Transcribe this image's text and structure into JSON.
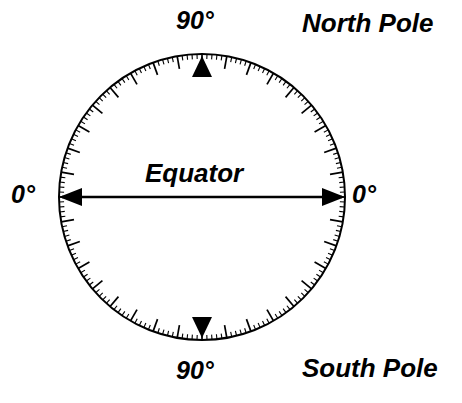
{
  "figure": {
    "background_color": "#ffffff",
    "ink_color": "#000000"
  },
  "labels": {
    "north_degree": "90°",
    "south_degree": "90°",
    "west_degree": "0°",
    "east_degree": "0°",
    "equator": "Equator",
    "north_pole": "North Pole",
    "south_pole": "South Pole"
  },
  "chart_data": {
    "type": "scatter",
    "xlabel": "",
    "ylabel": "",
    "grid": false,
    "legend_position": "none",
    "geometry": {
      "center_x": 202,
      "center_y": 197,
      "radius": 143,
      "stroke_width": 2
    },
    "annotations": [
      {
        "name": "north-pole-degree",
        "text": "90°",
        "angle_deg": 90,
        "position": "outside-top"
      },
      {
        "name": "south-pole-degree",
        "text": "90°",
        "angle_deg": -90,
        "position": "outside-bottom"
      },
      {
        "name": "west-equator-degree",
        "text": "0°",
        "angle_deg": 180,
        "position": "outside-left"
      },
      {
        "name": "east-equator-degree",
        "text": "0°",
        "angle_deg": 0,
        "position": "outside-right"
      },
      {
        "name": "equator-label",
        "text": "Equator",
        "angle_deg": null,
        "position": "center-above-axis"
      },
      {
        "name": "north-pole-label",
        "text": "North Pole",
        "angle_deg": null,
        "position": "upper-right"
      },
      {
        "name": "south-pole-label",
        "text": "South Pole",
        "angle_deg": null,
        "position": "lower-right"
      }
    ],
    "ticks": {
      "minor_interval_deg": 2,
      "minor_length_px": 5,
      "major_interval_deg": 10,
      "major_length_px": 13,
      "direction": "inward",
      "range_deg": [
        0,
        360
      ]
    },
    "markers": [
      {
        "name": "north-pole-marker",
        "shape": "triangle-up",
        "angle_deg": 90,
        "latitude": 90
      },
      {
        "name": "south-pole-marker",
        "shape": "triangle-down",
        "angle_deg": -90,
        "latitude": -90
      }
    ],
    "axis_arrow": {
      "name": "equator-axis",
      "from_angle_deg": 180,
      "to_angle_deg": 0,
      "double_headed": true,
      "y": 197,
      "x_start": 59,
      "x_end": 345
    }
  }
}
